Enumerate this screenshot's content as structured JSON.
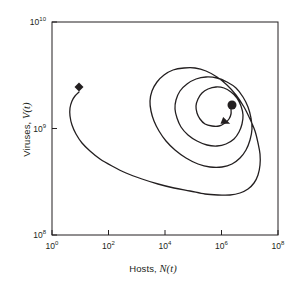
{
  "chart_data": {
    "type": "line",
    "title": "",
    "subtitle": "",
    "xlabel_prefix": "Hosts, ",
    "xlabel_var": "N",
    "xlabel_arg": "(t)",
    "ylabel_prefix": "Viruses, ",
    "ylabel_var": "V",
    "ylabel_arg": "(t)",
    "xscale": "log",
    "yscale": "log",
    "xlim": [
      1,
      100000000
    ],
    "ylim": [
      100000000,
      10000000000
    ],
    "grid": false,
    "legend": "none",
    "xticks": [
      {
        "label": "10",
        "exponent": "0",
        "value": 1
      },
      {
        "label": "10",
        "exponent": "2",
        "value": 100
      },
      {
        "label": "10",
        "exponent": "4",
        "value": 10000
      },
      {
        "label": "10",
        "exponent": "6",
        "value": 1000000
      },
      {
        "label": "10",
        "exponent": "8",
        "value": 100000000
      }
    ],
    "yticks": [
      {
        "label": "10",
        "exponent": "8",
        "value": 100000000
      },
      {
        "label": "10",
        "exponent": "9",
        "value": 1000000000
      },
      {
        "label": "10",
        "exponent": "10",
        "value": 10000000000
      }
    ],
    "series": [
      {
        "name": "trajectory",
        "description": "inward spiral trajectory from initial condition to stable fixed point",
        "color": "#231f20",
        "linewidth": 1.3,
        "points_px": [
          [
            79,
            92
          ],
          [
            75,
            96
          ],
          [
            72,
            101
          ],
          [
            70,
            108
          ],
          [
            70,
            116
          ],
          [
            72,
            125
          ],
          [
            76,
            134
          ],
          [
            82,
            143
          ],
          [
            90,
            151
          ],
          [
            100,
            159
          ],
          [
            112,
            166
          ],
          [
            126,
            173
          ],
          [
            142,
            179
          ],
          [
            158,
            184
          ],
          [
            174,
            188
          ],
          [
            190,
            191
          ],
          [
            205,
            194
          ],
          [
            218,
            195
          ],
          [
            230,
            195
          ],
          [
            240,
            193
          ],
          [
            248,
            189
          ],
          [
            254,
            183
          ],
          [
            258,
            175
          ],
          [
            260,
            165
          ],
          [
            260,
            154
          ],
          [
            258,
            143
          ],
          [
            255,
            131
          ],
          [
            250,
            119
          ],
          [
            244,
            107
          ],
          [
            236,
            95
          ],
          [
            227,
            85
          ],
          [
            217,
            77
          ],
          [
            206,
            71
          ],
          [
            195,
            68
          ],
          [
            184,
            68
          ],
          [
            173,
            70
          ],
          [
            164,
            75
          ],
          [
            157,
            82
          ],
          [
            152,
            91
          ],
          [
            150,
            101
          ],
          [
            151,
            111
          ],
          [
            154,
            121
          ],
          [
            159,
            131
          ],
          [
            166,
            141
          ],
          [
            175,
            150
          ],
          [
            186,
            158
          ],
          [
            198,
            164
          ],
          [
            210,
            167
          ],
          [
            222,
            167
          ],
          [
            232,
            164
          ],
          [
            240,
            158
          ],
          [
            246,
            150
          ],
          [
            250,
            140
          ],
          [
            252,
            129
          ],
          [
            251,
            118
          ],
          [
            248,
            107
          ],
          [
            243,
            97
          ],
          [
            236,
            88
          ],
          [
            227,
            82
          ],
          [
            217,
            78
          ],
          [
            206,
            77
          ],
          [
            196,
            79
          ],
          [
            187,
            84
          ],
          [
            180,
            91
          ],
          [
            176,
            100
          ],
          [
            175,
            109
          ],
          [
            177,
            118
          ],
          [
            181,
            127
          ],
          [
            188,
            135
          ],
          [
            197,
            141
          ],
          [
            207,
            145
          ],
          [
            217,
            146
          ],
          [
            226,
            144
          ],
          [
            234,
            139
          ],
          [
            239,
            132
          ],
          [
            242,
            124
          ],
          [
            243,
            115
          ],
          [
            241,
            106
          ],
          [
            237,
            98
          ],
          [
            231,
            92
          ],
          [
            224,
            88
          ],
          [
            216,
            87
          ],
          [
            208,
            89
          ],
          [
            202,
            93
          ],
          [
            198,
            99
          ],
          [
            196,
            106
          ],
          [
            197,
            113
          ],
          [
            200,
            119
          ],
          [
            205,
            124
          ],
          [
            212,
            126
          ],
          [
            219,
            126
          ],
          [
            225,
            123
          ],
          [
            229,
            119
          ],
          [
            231,
            114
          ],
          [
            231,
            109
          ]
        ]
      }
    ],
    "markers": [
      {
        "name": "initial-condition",
        "shape": "diamond",
        "x_px": 79,
        "y_px": 87,
        "size_px": 9,
        "color": "#231f20"
      },
      {
        "name": "fixed-point",
        "shape": "circle",
        "x_px": 232,
        "y_px": 105,
        "size_px": 9,
        "color": "#231f20"
      }
    ],
    "annotations": [
      {
        "name": "direction-arrowhead",
        "type": "arrowhead",
        "x_px": 226,
        "y_px": 122,
        "angle_deg": 22,
        "color": "#231f20"
      }
    ]
  },
  "plot_frame": {
    "left_px": 52,
    "top_px": 22,
    "right_px": 278,
    "bottom_px": 235,
    "border_color": "#231f20",
    "background": "#ffffff"
  }
}
